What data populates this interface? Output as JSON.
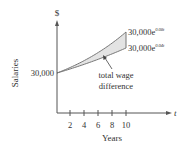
{
  "chart_data": {
    "type": "area",
    "title": "",
    "xlabel": "Years",
    "ylabel": "Salaries",
    "x_axis_var": "t",
    "y_axis_unit": "$",
    "x_ticks": [
      "2",
      "4",
      "6",
      "8",
      "10"
    ],
    "y_ticks": [
      "30,000"
    ],
    "xlim": [
      0,
      10
    ],
    "grid": false,
    "legend": "none",
    "series": [
      {
        "name": "30,000e^{0.08t}",
        "base": "30,000e",
        "exp": "0.08t",
        "x": [
          0,
          2,
          4,
          6,
          8,
          10
        ],
        "values": [
          30000,
          35204,
          41311,
          48481,
          56892,
          66766
        ]
      },
      {
        "name": "30,000e^{0.04t}",
        "base": "30,000e",
        "exp": "0.04t",
        "x": [
          0,
          2,
          4,
          6,
          8,
          10
        ],
        "values": [
          30000,
          32497,
          35204,
          38134,
          41311,
          44755
        ]
      }
    ],
    "shaded_region": {
      "between": [
        "30,000e^{0.08t}",
        "30,000e^{0.04t}"
      ],
      "from": 0,
      "to": 10,
      "color": "#e3e3e3"
    },
    "annotations": [
      {
        "text": [
          "total wage",
          "difference"
        ],
        "arrow_to": "shaded_region"
      }
    ]
  },
  "labels": {
    "dollar": "$",
    "ylabel": "Salaries",
    "y_start": "30,000",
    "t": "t",
    "xlabel": "Years",
    "upper_base": "30,000e",
    "upper_exp": "0.08t",
    "lower_base": "30,000e",
    "lower_exp": "0.04t",
    "annot_line1": "total wage",
    "annot_line2": "difference",
    "ticks": [
      "2",
      "4",
      "6",
      "8",
      "10"
    ]
  },
  "colors": {
    "axis": "#555555",
    "curve": "#777777",
    "fill": "#e3e3e3",
    "text": "#333333"
  }
}
